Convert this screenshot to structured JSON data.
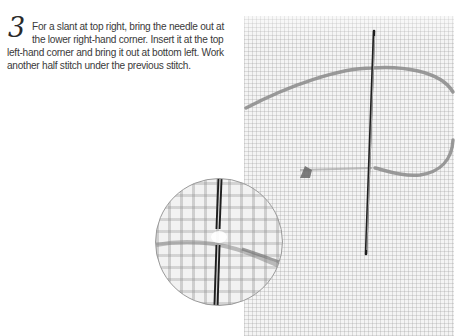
{
  "instruction": {
    "step_number": "3",
    "text": "For a slant at top right, bring the needle out at the lower right-hand corner. Insert it at the top left-hand corner and bring it out at bottom left. Work another half stitch under the previous stitch.",
    "lines": [
      "For a slant at top right, bring the needle out at",
      "the lower right-hand corner. Insert it at the top",
      "left-hand corner and bring it out at bottom left. Work",
      "another half stitch under the previous stitch."
    ]
  },
  "illustration": {
    "subject": "needle-through-evenweave-fabric",
    "inset": "magnified-view-of-stitch",
    "colors": {
      "fabric": "#f4f4f4",
      "thread": "#8a8a8a",
      "needle": "#222222",
      "circle_border": "#9a9a9a"
    }
  }
}
